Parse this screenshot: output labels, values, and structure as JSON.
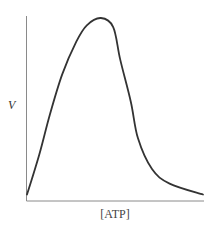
{
  "chart_data": {
    "type": "line",
    "title": "",
    "xlabel": "[ATP]",
    "ylabel": "V",
    "x_ticks": [],
    "y_ticks": [],
    "grid": false,
    "legend": null,
    "series": [
      {
        "name": "V",
        "color": "#333333",
        "points_normalized": [
          {
            "x": 0.0,
            "y": 0.03
          },
          {
            "x": 0.07,
            "y": 0.25
          },
          {
            "x": 0.13,
            "y": 0.47
          },
          {
            "x": 0.2,
            "y": 0.69
          },
          {
            "x": 0.28,
            "y": 0.87
          },
          {
            "x": 0.34,
            "y": 0.96
          },
          {
            "x": 0.42,
            "y": 1.0
          },
          {
            "x": 0.49,
            "y": 0.95
          },
          {
            "x": 0.53,
            "y": 0.77
          },
          {
            "x": 0.59,
            "y": 0.54
          },
          {
            "x": 0.63,
            "y": 0.34
          },
          {
            "x": 0.71,
            "y": 0.17
          },
          {
            "x": 0.81,
            "y": 0.09
          },
          {
            "x": 1.0,
            "y": 0.03
          }
        ]
      }
    ],
    "xlim": [
      0,
      1
    ],
    "ylim": [
      0,
      1
    ]
  },
  "axes": {
    "color": "#888888",
    "curve_color": "#333333"
  }
}
